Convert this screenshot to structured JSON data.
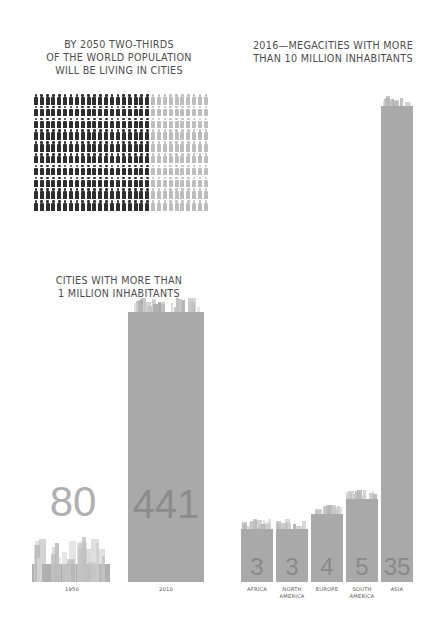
{
  "headings": {
    "population": "BY 2050 TWO-THIRDS\nOF THE WORLD POPULATION\nWILL BE LIVING IN CITIES",
    "megacities": "2016—MEGACITIES WITH MORE\nTHAN 10 MILLION INHABITANTS",
    "million_cities": "CITIES WITH MORE THAN\n1 MILLION INHABITANTS"
  },
  "colors": {
    "urban_people": "#2e2e2e",
    "rural_people": "#bdbdbd",
    "bar": "#a9a9a9",
    "value_text": "#8a8a8a"
  },
  "chart_data": [
    {
      "type": "pictogram",
      "title": "BY 2050 TWO-THIRDS OF THE WORLD POPULATION WILL BE LIVING IN CITIES",
      "rows": 10,
      "columns": 30,
      "series": [
        {
          "name": "Urban (2050)",
          "value": 200,
          "fraction": 0.667,
          "color": "#2e2e2e"
        },
        {
          "name": "Rural (2050)",
          "value": 100,
          "fraction": 0.333,
          "color": "#bdbdbd"
        }
      ]
    },
    {
      "type": "bar",
      "title": "CITIES WITH MORE THAN 1 MILLION INHABITANTS",
      "categories": [
        "1950",
        "2010"
      ],
      "values": [
        80,
        441
      ],
      "xlabel": "",
      "ylabel": "",
      "ylim": [
        0,
        441
      ]
    },
    {
      "type": "bar",
      "title": "2016—MEGACITIES WITH MORE THAN 10 MILLION INHABITANTS",
      "categories": [
        "AFRICA",
        "NORTH AMERICA",
        "EUROPE",
        "SOUTH AMERICA",
        "ASIA"
      ],
      "values": [
        3,
        3,
        4,
        5,
        35
      ],
      "xlabel": "",
      "ylabel": "",
      "ylim": [
        0,
        35
      ]
    }
  ],
  "million_bars": [
    {
      "year": "1950",
      "value": "80"
    },
    {
      "year": "2010",
      "value": "441"
    }
  ],
  "megacity_bars": [
    {
      "label": "AFRICA",
      "value": "3"
    },
    {
      "label": "NORTH\nAMERICA",
      "value": "3"
    },
    {
      "label": "EUROPE",
      "value": "4"
    },
    {
      "label": "SOUTH\nAMERICA",
      "value": "5"
    },
    {
      "label": "ASIA",
      "value": "35"
    }
  ]
}
